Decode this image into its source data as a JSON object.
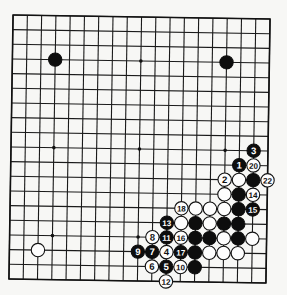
{
  "diagram": {
    "board_size": 19,
    "colors": {
      "background": "#f7f7f5",
      "lines": "#1a1a1a",
      "black_stone": "#0d0d0d",
      "white_stone": "#fdfdfd"
    },
    "star_points": [
      [
        3,
        3
      ],
      [
        9,
        3
      ],
      [
        15,
        3
      ],
      [
        3,
        9
      ],
      [
        9,
        9
      ],
      [
        15,
        9
      ],
      [
        3,
        15
      ],
      [
        9,
        15
      ],
      [
        15,
        15
      ]
    ],
    "stones": [
      {
        "color": "black",
        "col": 3,
        "row": 3,
        "label": ""
      },
      {
        "color": "black",
        "col": 15,
        "row": 3,
        "label": ""
      },
      {
        "color": "white",
        "col": 2,
        "row": 16,
        "label": ""
      },
      {
        "color": "black",
        "col": 17,
        "row": 9,
        "label": "3"
      },
      {
        "color": "black",
        "col": 16,
        "row": 10,
        "label": "1"
      },
      {
        "color": "white",
        "col": 17,
        "row": 10,
        "label": "20"
      },
      {
        "color": "white",
        "col": 15,
        "row": 11,
        "label": "2"
      },
      {
        "color": "white",
        "col": 16,
        "row": 11,
        "label": ""
      },
      {
        "color": "black",
        "col": 17,
        "row": 11,
        "label": ""
      },
      {
        "color": "white",
        "col": 18,
        "row": 11,
        "label": "22"
      },
      {
        "color": "white",
        "col": 15,
        "row": 12,
        "label": ""
      },
      {
        "color": "black",
        "col": 16,
        "row": 12,
        "label": ""
      },
      {
        "color": "white",
        "col": 17,
        "row": 12,
        "label": "14"
      },
      {
        "color": "white",
        "col": 12,
        "row": 13,
        "label": "18"
      },
      {
        "color": "white",
        "col": 13,
        "row": 13,
        "label": ""
      },
      {
        "color": "white",
        "col": 14,
        "row": 13,
        "label": ""
      },
      {
        "color": "white",
        "col": 15,
        "row": 13,
        "label": ""
      },
      {
        "color": "black",
        "col": 16,
        "row": 13,
        "label": ""
      },
      {
        "color": "black",
        "col": 17,
        "row": 13,
        "label": "15"
      },
      {
        "color": "black",
        "col": 11,
        "row": 14,
        "label": "13"
      },
      {
        "color": "white",
        "col": 12,
        "row": 14,
        "label": ""
      },
      {
        "color": "black",
        "col": 13,
        "row": 14,
        "label": ""
      },
      {
        "color": "white",
        "col": 14,
        "row": 14,
        "label": ""
      },
      {
        "color": "black",
        "col": 15,
        "row": 14,
        "label": ""
      },
      {
        "color": "black",
        "col": 16,
        "row": 14,
        "label": ""
      },
      {
        "color": "white",
        "col": 10,
        "row": 15,
        "label": "8"
      },
      {
        "color": "black",
        "col": 11,
        "row": 15,
        "label": "11"
      },
      {
        "color": "white",
        "col": 12,
        "row": 15,
        "label": "16"
      },
      {
        "color": "black",
        "col": 13,
        "row": 15,
        "label": ""
      },
      {
        "color": "black",
        "col": 14,
        "row": 15,
        "label": ""
      },
      {
        "color": "white",
        "col": 15,
        "row": 15,
        "label": ""
      },
      {
        "color": "black",
        "col": 16,
        "row": 15,
        "label": ""
      },
      {
        "color": "white",
        "col": 17,
        "row": 15,
        "label": ""
      },
      {
        "color": "black",
        "col": 9,
        "row": 16,
        "label": "9"
      },
      {
        "color": "black",
        "col": 10,
        "row": 16,
        "label": "7"
      },
      {
        "color": "white",
        "col": 11,
        "row": 16,
        "label": "4"
      },
      {
        "color": "black",
        "col": 12,
        "row": 16,
        "label": "17"
      },
      {
        "color": "black",
        "col": 13,
        "row": 16,
        "label": ""
      },
      {
        "color": "white",
        "col": 14,
        "row": 16,
        "label": ""
      },
      {
        "color": "white",
        "col": 15,
        "row": 16,
        "label": ""
      },
      {
        "color": "white",
        "col": 16,
        "row": 16,
        "label": ""
      },
      {
        "color": "white",
        "col": 10,
        "row": 17,
        "label": "6"
      },
      {
        "color": "black",
        "col": 11,
        "row": 17,
        "label": "5"
      },
      {
        "color": "white",
        "col": 12,
        "row": 17,
        "label": "10"
      },
      {
        "color": "black",
        "col": 13,
        "row": 17,
        "label": ""
      },
      {
        "color": "white",
        "col": 11,
        "row": 18,
        "label": "12"
      }
    ]
  }
}
